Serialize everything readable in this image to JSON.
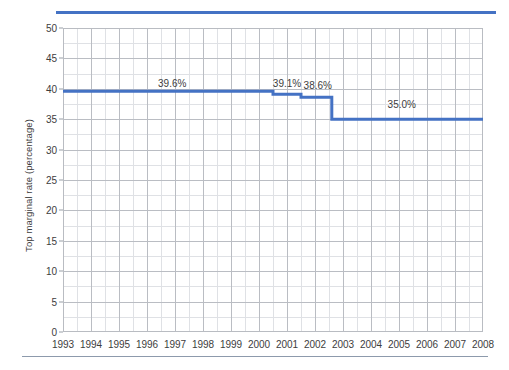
{
  "decoration": {
    "top_rule_color": "#4472C4",
    "bottom_rule_color": "#8D9AAC"
  },
  "chart_data": {
    "type": "line",
    "line_style": "step",
    "title": "",
    "subtitle": "",
    "xlabel": "",
    "ylabel": "Top marginal rate (percentage)",
    "xlim": [
      1993,
      2008
    ],
    "ylim": [
      0,
      50
    ],
    "grid": true,
    "legend": false,
    "legend_position": "none",
    "series_color": "#4472C4",
    "x_tick_labels": [
      "1993",
      "1994",
      "1995",
      "1996",
      "1997",
      "1998",
      "1999",
      "2000",
      "2001",
      "2002",
      "2003",
      "2004",
      "2005",
      "2006",
      "2007",
      "2008"
    ],
    "y_tick_labels": [
      "0",
      "5",
      "10",
      "15",
      "20",
      "25",
      "30",
      "35",
      "40",
      "45",
      "50"
    ],
    "y_ticks": [
      0,
      5,
      10,
      15,
      20,
      25,
      30,
      35,
      40,
      45,
      50
    ],
    "x": [
      1993,
      1994,
      1995,
      1996,
      1997,
      1998,
      1999,
      2000,
      2000.5,
      2001,
      2001.5,
      2002,
      2002.5,
      2003,
      2004,
      2005,
      2006,
      2007,
      2008
    ],
    "values": [
      39.6,
      39.6,
      39.6,
      39.6,
      39.6,
      39.6,
      39.6,
      39.6,
      39.1,
      39.1,
      38.6,
      38.6,
      38.6,
      35.0,
      35.0,
      35.0,
      35.0,
      35.0,
      35.0
    ],
    "steps": [
      {
        "x_start": 1993,
        "x_end": 2000.5,
        "value": 39.6
      },
      {
        "x_start": 2000.5,
        "x_end": 2001.5,
        "value": 39.1
      },
      {
        "x_start": 2001.5,
        "x_end": 2002.6,
        "value": 38.6
      },
      {
        "x_start": 2002.6,
        "x_end": 2008,
        "value": 35.0
      }
    ],
    "annotations": [
      {
        "text": "39.6%",
        "x": 1996.9,
        "y": 39.6
      },
      {
        "text": "39.1%",
        "x": 2001.0,
        "y": 39.6
      },
      {
        "text": "38.6%",
        "x": 2002.1,
        "y": 39.3
      },
      {
        "text": "35.0%",
        "x": 2005.1,
        "y": 36.2
      }
    ]
  }
}
